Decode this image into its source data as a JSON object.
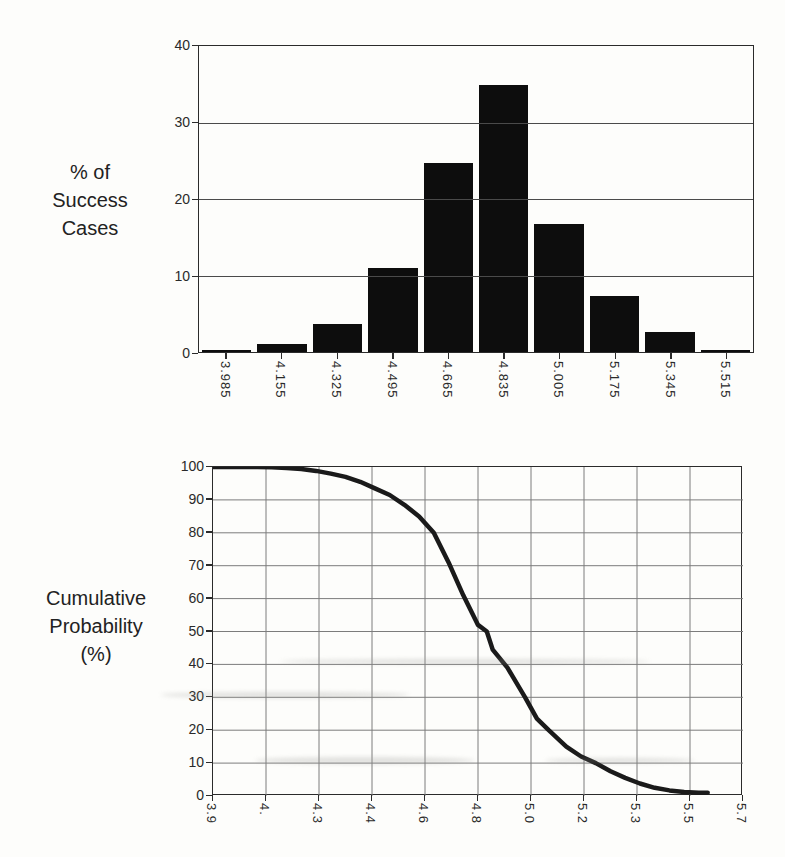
{
  "figure": {
    "hist_title_lines": [
      "% of",
      "Success",
      "Cases"
    ],
    "cdf_title_lines": [
      "Cumulative",
      "Probability",
      "(%)"
    ]
  },
  "colors": {
    "ink": "#1c1c1c",
    "bar_fill": "#0d0d0d",
    "curve": "#1a1a1a",
    "grid_dark": "#4a4a4a",
    "grid_light": "#7c7c7c",
    "background": "#fdfdfb"
  },
  "chart_data": [
    {
      "type": "bar",
      "title": "",
      "ylabel": "% of Success Cases",
      "xlabel": "",
      "categories": [
        "3.985",
        "4.155",
        "4.325",
        "4.495",
        "4.665",
        "4.835",
        "5.005",
        "5.175",
        "5.345",
        "5.515"
      ],
      "values": [
        0.3,
        1.0,
        3.6,
        11.0,
        24.7,
        34.9,
        16.7,
        7.3,
        2.6,
        0.2
      ],
      "ylim": [
        0,
        40
      ],
      "y_ticks": [
        0,
        10,
        20,
        30,
        40
      ],
      "grid": "horizontal",
      "legend_position": "none"
    },
    {
      "type": "line",
      "title": "",
      "ylabel": "Cumulative Probability (%)",
      "xlabel": "",
      "xlim": [
        3.9,
        5.7
      ],
      "ylim": [
        0,
        100
      ],
      "x_tick_labels": [
        "3.9",
        "4.",
        "4.3",
        "4.4",
        "4.6",
        "4.8",
        "5.0",
        "5.2",
        "5.3",
        "5.5",
        "5.7"
      ],
      "x_tick_values": [
        3.9,
        4.08,
        4.26,
        4.44,
        4.62,
        4.8,
        4.98,
        5.16,
        5.34,
        5.52,
        5.7
      ],
      "y_ticks": [
        0,
        10,
        20,
        30,
        40,
        50,
        60,
        70,
        80,
        90,
        100
      ],
      "grid": "both",
      "legend_position": "none",
      "points": [
        [
          3.9,
          100
        ],
        [
          4.0,
          100
        ],
        [
          4.05,
          100
        ],
        [
          4.1,
          99.9
        ],
        [
          4.15,
          99.7
        ],
        [
          4.2,
          99.4
        ],
        [
          4.25,
          98.8
        ],
        [
          4.3,
          98.0
        ],
        [
          4.35,
          97.0
        ],
        [
          4.4,
          95.5
        ],
        [
          4.45,
          93.5
        ],
        [
          4.5,
          91.5
        ],
        [
          4.55,
          88.5
        ],
        [
          4.6,
          85.0
        ],
        [
          4.65,
          80.0
        ],
        [
          4.7,
          71.0
        ],
        [
          4.75,
          61.0
        ],
        [
          4.8,
          52.0
        ],
        [
          4.83,
          50.0
        ],
        [
          4.85,
          44.5
        ],
        [
          4.9,
          39.0
        ],
        [
          4.96,
          30.0
        ],
        [
          5.0,
          23.5
        ],
        [
          5.04,
          20.0
        ],
        [
          5.1,
          15.0
        ],
        [
          5.15,
          12.0
        ],
        [
          5.2,
          10.0
        ],
        [
          5.25,
          7.5
        ],
        [
          5.3,
          5.5
        ],
        [
          5.35,
          3.8
        ],
        [
          5.4,
          2.5
        ],
        [
          5.45,
          1.7
        ],
        [
          5.5,
          1.2
        ],
        [
          5.55,
          1.0
        ],
        [
          5.58,
          1.0
        ]
      ]
    }
  ]
}
